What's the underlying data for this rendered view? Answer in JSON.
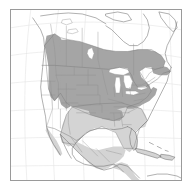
{
  "figure": {
    "type": "range-map",
    "region": "North America",
    "title": "",
    "frame": {
      "x": 10,
      "y": 9,
      "width": 172,
      "height": 172,
      "border_color": "#9a9a9a"
    },
    "background_color": "#ffffff"
  },
  "legend": {
    "visible": false,
    "classes": [
      {
        "name": "core-range",
        "label": "Core / breeding range",
        "color": "#a8a8a8"
      },
      {
        "name": "secondary-range",
        "label": "Secondary / wintering range",
        "color": "#d2d2d2"
      },
      {
        "name": "outside-range",
        "label": "Outside range",
        "color": "#ffffff"
      }
    ]
  },
  "map_layers": {
    "graticule": {
      "visible": true,
      "color": "#e2e2e2",
      "spacing_note": "lat/long lines"
    },
    "coastline": {
      "color": "#6e6e6e"
    },
    "country_borders": {
      "color": "#7a7a7a"
    },
    "state_borders": {
      "color": "#8c8c8c"
    },
    "lakes": {
      "color": "#ffffff",
      "names": [
        "Superior",
        "Michigan",
        "Huron",
        "Erie",
        "Ontario",
        "Winnipeg",
        "Great Bear",
        "Great Slave"
      ]
    }
  },
  "range_data": {
    "core_regions": [
      "British Columbia (southeast)",
      "Alberta",
      "Saskatchewan (south)",
      "Manitoba (south)",
      "Ontario (south)",
      "Quebec (south)",
      "Montana",
      "North Dakota",
      "South Dakota",
      "Minnesota",
      "Wisconsin",
      "Michigan",
      "Iowa",
      "Illinois",
      "Indiana",
      "Ohio",
      "Pennsylvania",
      "New York",
      "New England",
      "Appalachians",
      "Wyoming",
      "Colorado",
      "Nebraska",
      "Kansas",
      "Missouri",
      "Kentucky",
      "Tennessee",
      "Virginia"
    ],
    "secondary_regions": [
      "Texas",
      "Oklahoma",
      "Arkansas",
      "Louisiana",
      "Mississippi",
      "Alabama",
      "Georgia",
      "Florida",
      "South Carolina",
      "North Carolina",
      "Mexico",
      "Yucatan",
      "Belize",
      "Guatemala",
      "Honduras",
      "Cuba",
      "Hispaniola",
      "Bahamas"
    ]
  },
  "axis_labels": {
    "visible": false
  }
}
